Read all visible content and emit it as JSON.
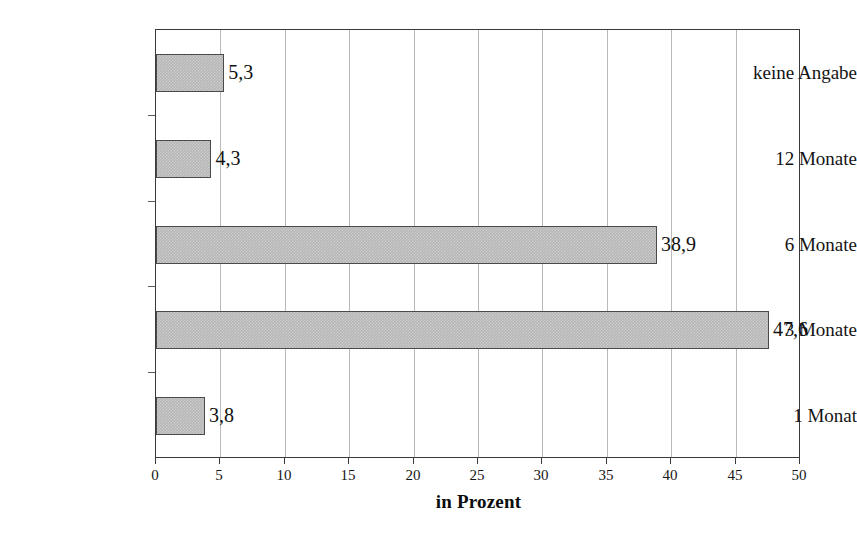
{
  "chart_data": {
    "type": "bar",
    "orientation": "horizontal",
    "title": "",
    "subtitle": "",
    "xlabel": "in Prozent",
    "ylabel": "",
    "categories": [
      "1 Monat",
      "3 Monate",
      "6 Monate",
      "12 Monate",
      "keine Angabe"
    ],
    "values": [
      3.8,
      47.6,
      38.9,
      4.3,
      5.3
    ],
    "value_labels": [
      "3,8",
      "47,6",
      "38,9",
      "4,3",
      "5,3"
    ],
    "xlim": [
      0,
      50
    ],
    "xticks": [
      0,
      5,
      10,
      15,
      20,
      25,
      30,
      35,
      40,
      45,
      50
    ],
    "xtick_labels": [
      "0",
      "5",
      "10",
      "15",
      "20",
      "25",
      "30",
      "35",
      "40",
      "45",
      "50"
    ],
    "grid": "vertical",
    "legend": "none",
    "decimal_separator": ",",
    "colors": {
      "bar_fill": "#b6b6b6",
      "bar_border": "#4a4a4a",
      "gridline": "#b9b9b9",
      "axis": "#3a3a3a",
      "text": "#141414",
      "background": "#ffffff"
    }
  },
  "bars": [
    {
      "category": "keine Angabe",
      "value": 5.3,
      "label": "5,3"
    },
    {
      "category": "12 Monate",
      "value": 4.3,
      "label": "4,3"
    },
    {
      "category": "6 Monate",
      "value": 38.9,
      "label": "38,9"
    },
    {
      "category": "3 Monate",
      "value": 47.6,
      "label": "47,6"
    },
    {
      "category": "1 Monat",
      "value": 3.8,
      "label": "3,8"
    }
  ],
  "axis": {
    "x_title": "in Prozent",
    "ticks": [
      {
        "value": 0,
        "label": "0"
      },
      {
        "value": 5,
        "label": "5"
      },
      {
        "value": 10,
        "label": "10"
      },
      {
        "value": 15,
        "label": "15"
      },
      {
        "value": 20,
        "label": "20"
      },
      {
        "value": 25,
        "label": "25"
      },
      {
        "value": 30,
        "label": "30"
      },
      {
        "value": 35,
        "label": "35"
      },
      {
        "value": 40,
        "label": "40"
      },
      {
        "value": 45,
        "label": "45"
      },
      {
        "value": 50,
        "label": "50"
      }
    ]
  }
}
